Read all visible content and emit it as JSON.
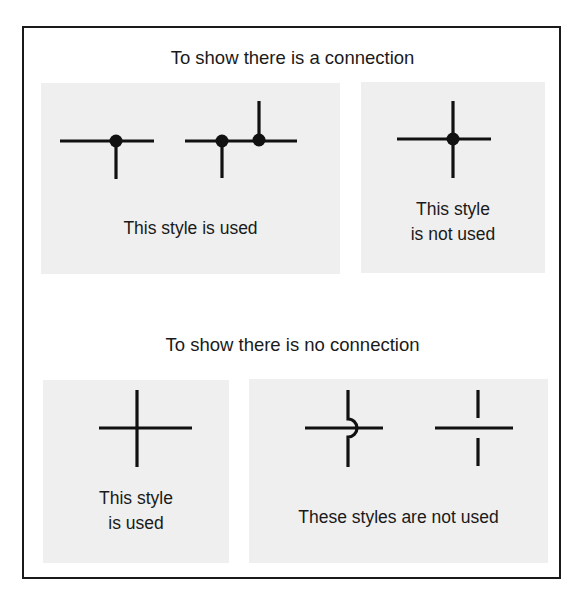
{
  "diagram": {
    "sections": [
      {
        "heading": "To show there is a connection",
        "panels": [
          {
            "label": "This style is used",
            "label_lines": [
              "This style is used"
            ],
            "symbols": [
              "t-junction-with-dot",
              "double-t-junction-with-dots"
            ],
            "verdict": "used"
          },
          {
            "label": "This style is not used",
            "label_lines": [
              "This style",
              "is not used"
            ],
            "symbols": [
              "four-way-cross-with-dot"
            ],
            "verdict": "not used"
          }
        ]
      },
      {
        "heading": "To show there is no connection",
        "panels": [
          {
            "label": "This style is used",
            "label_lines": [
              "This style",
              "is used"
            ],
            "symbols": [
              "plain-crossing"
            ],
            "verdict": "used"
          },
          {
            "label": "These styles are not used",
            "label_lines": [
              "These styles are not used"
            ],
            "symbols": [
              "hop-over-crossing",
              "broken-crossing"
            ],
            "verdict": "not used"
          }
        ]
      }
    ]
  },
  "colors": {
    "line": "#111111",
    "panel_background": "#efefef",
    "frame_border": "#1a1a1a",
    "page_background": "#ffffff"
  }
}
